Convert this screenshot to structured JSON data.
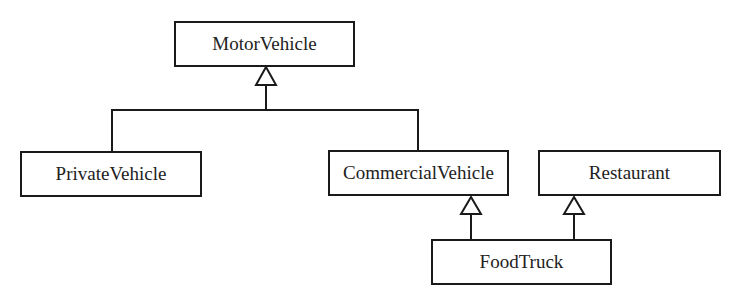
{
  "diagram": {
    "type": "uml-class-inheritance",
    "line_color": "#1a1a1a",
    "classes": [
      {
        "id": "motor",
        "name": "MotorVehicle",
        "x": 174,
        "y": 21,
        "w": 181,
        "h": 46
      },
      {
        "id": "private",
        "name": "PrivateVehicle",
        "x": 20,
        "y": 151,
        "w": 182,
        "h": 46
      },
      {
        "id": "commercial",
        "name": "CommercialVehicle",
        "x": 328,
        "y": 150,
        "w": 181,
        "h": 46
      },
      {
        "id": "restaurant",
        "name": "Restaurant",
        "x": 538,
        "y": 150,
        "w": 183,
        "h": 46
      },
      {
        "id": "foodtruck",
        "name": "FoodTruck",
        "x": 431,
        "y": 239,
        "w": 181,
        "h": 46
      }
    ],
    "relations": [
      {
        "child": "PrivateVehicle",
        "parent": "MotorVehicle",
        "kind": "generalization"
      },
      {
        "child": "CommercialVehicle",
        "parent": "MotorVehicle",
        "kind": "generalization"
      },
      {
        "child": "FoodTruck",
        "parent": "CommercialVehicle",
        "kind": "generalization"
      },
      {
        "child": "FoodTruck",
        "parent": "Restaurant",
        "kind": "generalization"
      }
    ]
  }
}
